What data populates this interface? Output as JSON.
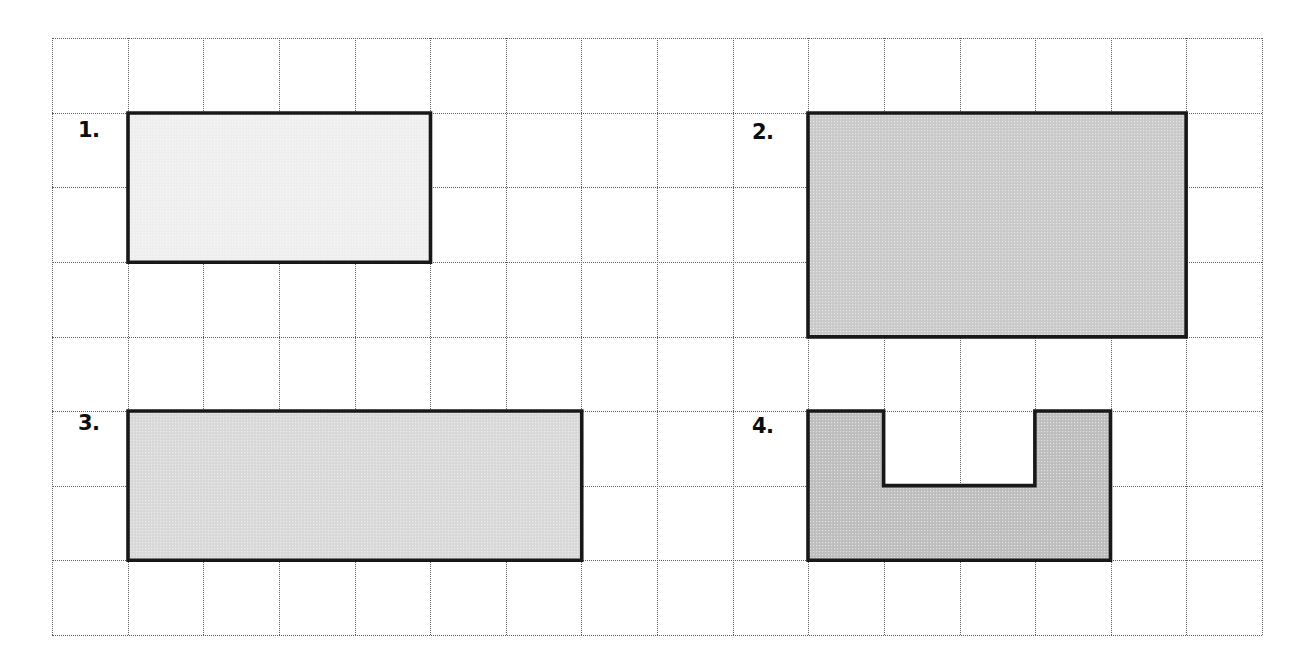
{
  "page": {
    "width": 1304,
    "height": 670,
    "background": "#ffffff"
  },
  "grid": {
    "name": "dotted-square-grid",
    "x": 52,
    "y": 38,
    "cell": 75.6,
    "cell_height": 74.6,
    "columns": 16,
    "rows": 8,
    "line_color": "#5d5d5d",
    "line_style": "dotted",
    "right": 1262,
    "bottom": 635
  },
  "shapes": [
    {
      "id": "shape-1",
      "label": "1.",
      "label_x": 78,
      "label_y": 120,
      "type": "rectangle",
      "col": 1,
      "row": 1,
      "cols_wide": 4,
      "rows_tall": 2,
      "area_squares": 8,
      "fill": "#eeeeee",
      "stroke": "#17181a"
    },
    {
      "id": "shape-2",
      "label": "2.",
      "label_x": 752,
      "label_y": 122,
      "type": "rectangle",
      "col": 10,
      "row": 1,
      "cols_wide": 5,
      "rows_tall": 3,
      "area_squares": 15,
      "fill": "#c9c9c9",
      "stroke": "#17181a"
    },
    {
      "id": "shape-3",
      "label": "3.",
      "label_x": 78,
      "label_y": 413,
      "type": "rectangle",
      "col": 1,
      "row": 5,
      "cols_wide": 6,
      "rows_tall": 2,
      "area_squares": 12,
      "fill": "#d8d8d8",
      "stroke": "#17181a"
    },
    {
      "id": "shape-4",
      "label": "4.",
      "label_x": 752,
      "label_y": 416,
      "type": "u-shape",
      "col": 10,
      "row": 5,
      "cols_wide": 4,
      "rows_tall": 2,
      "notch_left_cols": 1,
      "notch_right_cols": 1,
      "notch_depth_rows": 1,
      "area_squares": 6,
      "fill": "#bdbdbd",
      "stroke": "#17181a"
    }
  ],
  "colors": {
    "ink": "#17181a",
    "grid": "#5d5d5d",
    "paper": "#ffffff"
  }
}
